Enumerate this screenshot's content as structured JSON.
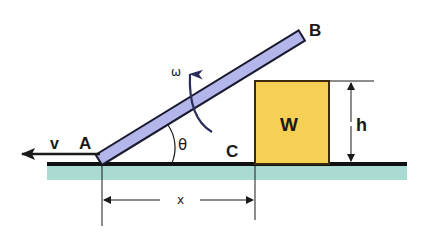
{
  "diagram": {
    "title": "",
    "labels": {
      "point_a": "A",
      "point_b": "B",
      "point_c": "C",
      "block": "W",
      "height": "h",
      "distance": "x",
      "velocity": "v",
      "angle": "θ",
      "angular_velocity": "ω"
    },
    "colors": {
      "bar_fill": "#b3b6ea",
      "block_fill": "#f6cf55",
      "ground_line": "#111111",
      "ground_fill": "#a9dbd3",
      "outline": "#222222",
      "arrow": "#2b2d5a"
    },
    "elements": [
      {
        "id": "bar-AB",
        "type": "inclined rod",
        "from": "A",
        "to": "B"
      },
      {
        "id": "block-W",
        "type": "block",
        "label": "W"
      },
      {
        "id": "ground",
        "type": "floor"
      },
      {
        "id": "dim-x",
        "type": "dimension",
        "label": "x",
        "from": "A",
        "to": "C"
      },
      {
        "id": "dim-h",
        "type": "dimension",
        "label": "h"
      },
      {
        "id": "arrow-v",
        "type": "velocity arrow",
        "label": "v",
        "direction": "left"
      },
      {
        "id": "arc-theta",
        "type": "angle arc",
        "label": "θ"
      },
      {
        "id": "arrow-omega",
        "type": "rotation arrow",
        "label": "ω"
      }
    ]
  }
}
